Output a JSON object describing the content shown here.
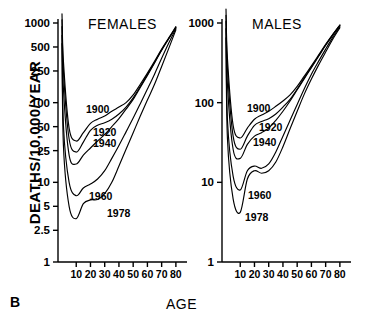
{
  "figure": {
    "panel_label": "B",
    "x_axis_title": "AGE",
    "y_axis_title": "DEATHS/10,000/YEAR"
  },
  "panels": [
    {
      "id": "females",
      "title": "FEMALES"
    },
    {
      "id": "males",
      "title": "MALES"
    }
  ],
  "curve_labels": {
    "females": [
      "1900",
      "1920",
      "1940",
      "1960",
      "1978"
    ],
    "males": [
      "1900",
      "1920",
      "1940",
      "1960",
      "1978"
    ]
  },
  "axis_ticks": {
    "y_females": [
      "1000",
      "500",
      "250",
      "100",
      "50",
      "25",
      "10",
      "5",
      "2.5",
      "1"
    ],
    "y_males": [
      "1000",
      "100",
      "10",
      "1"
    ],
    "x": [
      "10",
      "20",
      "30",
      "40",
      "50",
      "60",
      "70",
      "80"
    ]
  },
  "chart_data": {
    "type": "line",
    "subtitle": "B",
    "xlabel": "AGE",
    "ylabel": "DEATHS/10,000/YEAR",
    "yscale": "log",
    "ylim": [
      1,
      1000
    ],
    "xlim": [
      0,
      85
    ],
    "grid": false,
    "legend": "inline-curve-labels",
    "y_ticks_left": [
      1000,
      500,
      250,
      100,
      50,
      25,
      10,
      5,
      2.5,
      1
    ],
    "y_ticks_right": [
      1000,
      100,
      10,
      1
    ],
    "x_ticks": [
      10,
      20,
      30,
      40,
      50,
      60,
      70,
      80
    ],
    "panels": [
      {
        "name": "FEMALES",
        "x": [
          0,
          1,
          5,
          10,
          15,
          20,
          25,
          30,
          35,
          40,
          45,
          50,
          55,
          60,
          65,
          70,
          75,
          80
        ],
        "series": [
          {
            "name": "1900",
            "values": [
              1300,
              330,
              48,
              33,
              42,
              55,
              62,
              68,
              78,
              88,
              100,
              125,
              170,
              235,
              330,
              470,
              650,
              900
            ]
          },
          {
            "name": "1920",
            "values": [
              1100,
              250,
              35,
              24,
              32,
              45,
              52,
              56,
              62,
              72,
              88,
              115,
              160,
              225,
              320,
              460,
              640,
              880
            ]
          },
          {
            "name": "1940",
            "values": [
              900,
              150,
              22,
              17,
              22,
              27,
              33,
              40,
              50,
              63,
              83,
              110,
              155,
              220,
              315,
              455,
              635,
              875
            ]
          },
          {
            "name": "1960",
            "values": [
              700,
              52,
              10,
              6.8,
              8.5,
              9.5,
              11,
              14,
              20,
              29,
              43,
              64,
              97,
              148,
              228,
              360,
              560,
              850
            ]
          },
          {
            "name": "1978",
            "values": [
              550,
              29,
              5.0,
              3.5,
              5.4,
              6.0,
              6.1,
              7.2,
              10,
              16,
              26,
              42,
              68,
              108,
              170,
              285,
              480,
              820
            ]
          }
        ]
      },
      {
        "name": "MALES",
        "x": [
          0,
          1,
          5,
          10,
          15,
          20,
          25,
          30,
          35,
          40,
          45,
          50,
          55,
          60,
          65,
          70,
          75,
          80
        ],
        "series": [
          {
            "name": "1900",
            "values": [
              1500,
              360,
              52,
              36,
              48,
              62,
              70,
              78,
              90,
              105,
              125,
              160,
              215,
              290,
              395,
              540,
              720,
              950
            ]
          },
          {
            "name": "1920",
            "values": [
              1250,
              270,
              38,
              26,
              38,
              52,
              58,
              63,
              72,
              88,
              110,
              148,
              205,
              280,
              385,
              530,
              710,
              930
            ]
          },
          {
            "name": "1940",
            "values": [
              1050,
              170,
              26,
              20,
              30,
              38,
              42,
              48,
              60,
              78,
              105,
              145,
              200,
              275,
              380,
              525,
              705,
              925
            ]
          },
          {
            "name": "1960",
            "values": [
              850,
              62,
              12,
              8.0,
              14,
              16,
              15,
              17,
              24,
              38,
              60,
              95,
              150,
              228,
              330,
              470,
              660,
              900
            ]
          },
          {
            "name": "1978",
            "values": [
              650,
              36,
              6.2,
              4.2,
              11,
              14,
              13,
              14,
              18,
              28,
              47,
              78,
              128,
              198,
              296,
              432,
              625,
              870
            ]
          }
        ]
      }
    ]
  }
}
